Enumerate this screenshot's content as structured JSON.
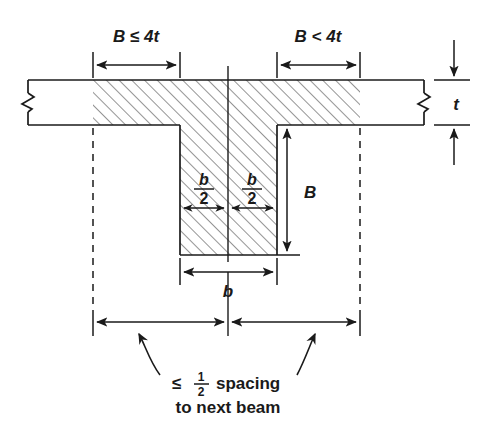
{
  "diagram": {
    "background_color": "#ffffff",
    "line_color": "#1a1a1a",
    "hatch_color": "#2b2b2b"
  },
  "labels": {
    "left_flange_dim": "B ≤ 4t",
    "right_flange_dim": "B < 4t",
    "thickness_dim": "t",
    "web_depth_dim": "B",
    "web_width_dim": "b",
    "half_width_numerator": "b",
    "half_width_denominator": "2",
    "caption_line1_prefix": "≤",
    "caption_line1_frac_num": "1",
    "caption_line1_frac_den": "2",
    "caption_line1_suffix": "spacing",
    "caption_line2": "to next beam"
  },
  "annotations": {
    "break_symbol_left": "break-symbol",
    "break_symbol_right": "break-symbol",
    "centerline": "centerline",
    "hatched_region": "effective-section-hatching"
  },
  "geometry": {
    "flange_top_y": 80,
    "flange_bottom_y": 125,
    "flange_left_x": 28,
    "flange_right_x": 424,
    "web_left_x": 180,
    "web_right_x": 277,
    "web_bottom_y": 255,
    "center_x": 228,
    "hatch_left_x": 93,
    "hatch_right_x": 360,
    "dashed_left_x": 93,
    "dashed_right_x": 360
  }
}
